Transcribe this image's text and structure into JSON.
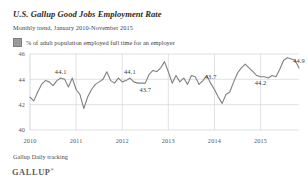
{
  "header": {
    "title": "U.S. Gallup Good Jobs Employment Rate",
    "subtitle": "Monthly trend, January 2010-November 2015"
  },
  "legend": {
    "label": "% of adult population employed full time for an employer",
    "swatch_color": "#9a9a9a"
  },
  "footer": {
    "source": "Gallup Daily tracking",
    "brand": "GALLUP",
    "brand_mark": "®"
  },
  "chart_data": {
    "type": "line",
    "title": "U.S. Gallup Good Jobs Employment Rate",
    "subtitle": "Monthly trend, January 2010-November 2015",
    "xlabel": "",
    "ylabel": "",
    "ylim": [
      40,
      46
    ],
    "yticks": [
      40,
      42,
      44,
      46
    ],
    "xticks": [
      "2010",
      "2011",
      "2012",
      "2013",
      "2014",
      "2015"
    ],
    "grid": true,
    "legend_position": "top-left",
    "line_color": "#808080",
    "series_name": "% of adult population employed full time for an employer",
    "x": [
      "2010-01",
      "2010-02",
      "2010-03",
      "2010-04",
      "2010-05",
      "2010-06",
      "2010-07",
      "2010-08",
      "2010-09",
      "2010-10",
      "2010-11",
      "2010-12",
      "2011-01",
      "2011-02",
      "2011-03",
      "2011-04",
      "2011-05",
      "2011-06",
      "2011-07",
      "2011-08",
      "2011-09",
      "2011-10",
      "2011-11",
      "2011-12",
      "2012-01",
      "2012-02",
      "2012-03",
      "2012-04",
      "2012-05",
      "2012-06",
      "2012-07",
      "2012-08",
      "2012-09",
      "2012-10",
      "2012-11",
      "2012-12",
      "2013-01",
      "2013-02",
      "2013-03",
      "2013-04",
      "2013-05",
      "2013-06",
      "2013-07",
      "2013-08",
      "2013-09",
      "2013-10",
      "2013-11",
      "2013-12",
      "2014-01",
      "2014-02",
      "2014-03",
      "2014-04",
      "2014-05",
      "2014-06",
      "2014-07",
      "2014-08",
      "2014-09",
      "2014-10",
      "2014-11",
      "2014-12",
      "2015-01",
      "2015-02",
      "2015-03",
      "2015-04",
      "2015-05",
      "2015-06",
      "2015-07",
      "2015-08",
      "2015-09",
      "2015-10",
      "2015-11"
    ],
    "values": [
      42.6,
      42.3,
      43.0,
      43.6,
      43.9,
      43.8,
      43.5,
      43.9,
      44.1,
      44.0,
      43.4,
      44.1,
      43.2,
      42.8,
      41.7,
      42.6,
      43.2,
      43.6,
      43.8,
      44.0,
      44.6,
      43.9,
      43.7,
      44.1,
      43.8,
      43.9,
      44.1,
      43.8,
      43.7,
      43.7,
      43.7,
      44.4,
      44.7,
      44.6,
      44.9,
      45.4,
      44.6,
      43.7,
      44.3,
      43.8,
      44.1,
      43.6,
      44.3,
      44.2,
      43.6,
      43.9,
      44.3,
      43.7,
      43.2,
      42.6,
      42.1,
      42.8,
      43.0,
      43.8,
      44.5,
      44.9,
      45.2,
      44.9,
      44.6,
      44.3,
      44.2,
      44.2,
      44.1,
      44.3,
      44.2,
      44.8,
      45.5,
      45.7,
      45.6,
      45.5,
      44.9
    ],
    "point_labels": [
      {
        "text": "44.1",
        "index": 8
      },
      {
        "text": "44.1",
        "index": 26
      },
      {
        "text": "43.7",
        "index": 30
      },
      {
        "text": "43.7",
        "index": 47
      },
      {
        "text": "44.2",
        "index": 60
      },
      {
        "text": "44.9",
        "index": 70
      }
    ]
  }
}
